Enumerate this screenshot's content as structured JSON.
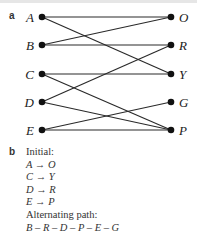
{
  "panel_a": {
    "label": "a",
    "left_nodes": [
      {
        "id": "A",
        "label": "A",
        "x": 42,
        "y": 17
      },
      {
        "id": "B",
        "label": "B",
        "x": 42,
        "y": 45
      },
      {
        "id": "C",
        "label": "C",
        "x": 42,
        "y": 74
      },
      {
        "id": "D",
        "label": "D",
        "x": 42,
        "y": 102
      },
      {
        "id": "E",
        "label": "E",
        "x": 42,
        "y": 130
      }
    ],
    "right_nodes": [
      {
        "id": "O",
        "label": "O",
        "x": 171,
        "y": 17
      },
      {
        "id": "R",
        "label": "R",
        "x": 171,
        "y": 45
      },
      {
        "id": "Y",
        "label": "Y",
        "x": 171,
        "y": 74
      },
      {
        "id": "G",
        "label": "G",
        "x": 171,
        "y": 102
      },
      {
        "id": "P",
        "label": "P",
        "x": 171,
        "y": 130
      }
    ],
    "edges": [
      [
        "A",
        "O"
      ],
      [
        "A",
        "Y"
      ],
      [
        "B",
        "O"
      ],
      [
        "B",
        "R"
      ],
      [
        "C",
        "Y"
      ],
      [
        "C",
        "P"
      ],
      [
        "D",
        "R"
      ],
      [
        "D",
        "P"
      ],
      [
        "E",
        "G"
      ],
      [
        "E",
        "P"
      ]
    ],
    "colors": {
      "edge": "#2a2a2a",
      "node": "#111111"
    }
  },
  "panel_b": {
    "label": "b",
    "initial_heading": "Initial:",
    "initial_matching": [
      "A → O",
      "C → Y",
      "D → R",
      "E → P"
    ],
    "path_heading": "Alternating path:",
    "path": "B – R – D – P – E – G"
  }
}
